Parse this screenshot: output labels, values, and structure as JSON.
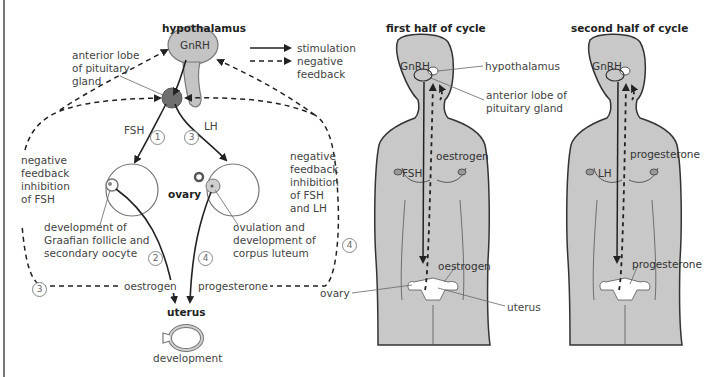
{
  "diagram": {
    "left_panel": {
      "title": "hypothalamus",
      "hormone_gnrh": "GnRH",
      "pituitary_label": [
        "anterior lobe",
        "of pituitary",
        "gland"
      ],
      "legend": {
        "stimulation": "stimulation",
        "negative_feedback": [
          "negative",
          "feedback"
        ]
      },
      "fsh": "FSH",
      "lh": "LH",
      "step_numbers": [
        "1",
        "2",
        "3",
        "4"
      ],
      "left_feedback": [
        "negative",
        "feedback",
        "inhibition",
        "of FSH"
      ],
      "right_feedback": [
        "negative",
        "feedback",
        "inhibition",
        "of FSH",
        "and LH"
      ],
      "ovary": "ovary",
      "graafian": [
        "development of",
        "Graafian follicle and",
        "secondary oocyte"
      ],
      "ovulation": [
        "ovulation and",
        "development of",
        "corpus luteum"
      ],
      "oestrogen": "oestrogen",
      "progesterone": "progesterone",
      "uterus": "uterus",
      "development": "development"
    },
    "middle_panel": {
      "title": "first half of cycle",
      "gnrh": "GnRH",
      "hypothalamus": "hypothalamus",
      "pituitary": [
        "anterior lobe of",
        "pituitary gland"
      ],
      "hormone_down": "FSH",
      "hormone_up": "oestrogen",
      "hormone_up_lower": "oestrogen",
      "ovary": "ovary",
      "uterus": "uterus"
    },
    "right_panel": {
      "title": "second half of cycle",
      "gnrh": "GnRH",
      "hormone_down": "LH",
      "hormone_up": "progesterone",
      "hormone_up_lower": "progesterone"
    },
    "colors": {
      "body_fill": "#c8c8c8",
      "gland_fill": "#bdbdbd",
      "pituitary_fill": "#6f6f6f",
      "line": "#222222",
      "text": "#444444"
    }
  }
}
